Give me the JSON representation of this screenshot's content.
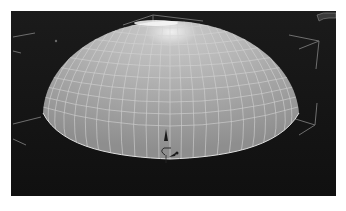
{
  "viewport": {
    "type": "3d-perspective-viewport",
    "background_color": "#141414",
    "object": {
      "name": "hemisphere-dome",
      "display": "wireframe-on-shaded",
      "surface_color": "#a8a8a8",
      "wire_color": "#d8d8d8",
      "highlight_color": "#f4f4f4"
    },
    "bounding_brackets_color": "#6e6e6e",
    "gizmo": {
      "type": "transform-manipulator",
      "color": "#1a1a1a"
    },
    "corner_widget": "view-cube-partial"
  }
}
